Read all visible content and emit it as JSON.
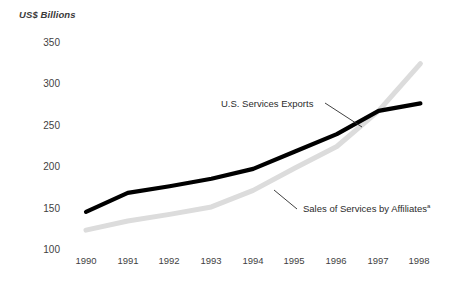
{
  "chart_data": {
    "type": "line",
    "title": "",
    "subtitle": "",
    "xlabel": "",
    "ylabel": "US$ Billions",
    "categories": [
      "1990",
      "1991",
      "1992",
      "1993",
      "1994",
      "1995",
      "1996",
      "1997",
      "1998"
    ],
    "x": [
      1990,
      1991,
      1992,
      1993,
      1994,
      1995,
      1996,
      1997,
      1998
    ],
    "ylim": [
      100,
      350
    ],
    "yticks": [
      100,
      150,
      200,
      250,
      300,
      350
    ],
    "grid": false,
    "legend_position": "inline-annotation",
    "series": [
      {
        "name": "U.S. Services Exports",
        "color": "#000000",
        "values": [
          146,
          169,
          177,
          186,
          198,
          219,
          240,
          268,
          277
        ]
      },
      {
        "name": "Sales of Services by Affiliates",
        "footnote_marker": "a",
        "color": "#dcdcdc",
        "values": [
          124,
          135,
          143,
          152,
          172,
          199,
          225,
          268,
          325
        ]
      }
    ],
    "annotations": [
      {
        "text": "U.S. Services Exports",
        "series": "U.S. Services Exports"
      },
      {
        "text": "Sales of Services by Affiliates",
        "marker": "a",
        "series": "Sales of Services by Affiliates"
      }
    ]
  },
  "axis": {
    "ylabel": "US$ Billions",
    "yticks": [
      "350",
      "300",
      "250",
      "200",
      "150",
      "100"
    ],
    "xticks": [
      "1990",
      "1991",
      "1992",
      "1993",
      "1994",
      "1995",
      "1996",
      "1997",
      "1998"
    ]
  },
  "labels": {
    "exports": "U.S. Services Exports",
    "affiliates": "Sales of Services by Affiliates",
    "affiliates_marker": "a"
  }
}
